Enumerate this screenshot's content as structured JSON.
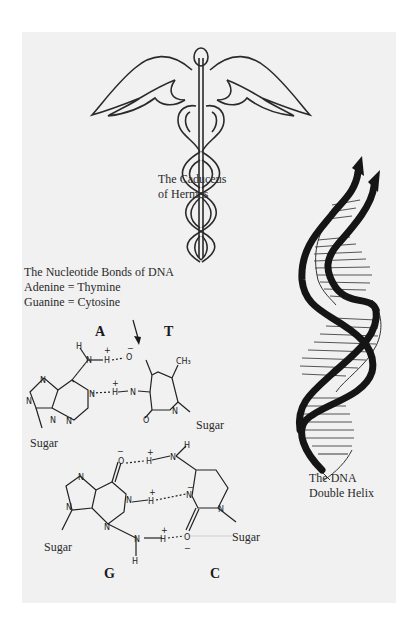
{
  "illustration": {
    "caduceus": {
      "label_line1": "The Caduceus",
      "label_line2": "of Hermes"
    },
    "nucleotide": {
      "title": "The Nucleotide Bonds of DNA",
      "pair1": "Adenine = Thymine",
      "pair2": "Guanine = Cytosine",
      "base_a": "A",
      "base_t": "T",
      "base_g": "G",
      "base_c": "C",
      "sugar_at_left": "Sugar",
      "sugar_at_right": "Sugar",
      "sugar_gc_left": "Sugar",
      "sugar_gc_right": "Sugar"
    },
    "helix": {
      "label_line1": "The DNA",
      "label_line2": "Double Helix"
    }
  },
  "colors": {
    "paper": "#f1f1f1",
    "ink": "#222222",
    "page": "#ffffff"
  }
}
